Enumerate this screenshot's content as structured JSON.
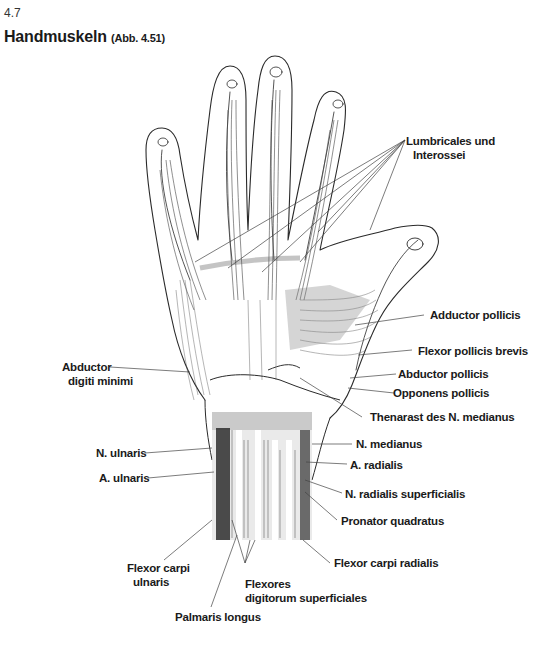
{
  "section": "4.7",
  "title": "Handmuskeln",
  "figure_ref": "(Abb. 4.51)",
  "labels": {
    "lumbricales": [
      "Lumbricales und",
      "Interossei"
    ],
    "adductor_pollicis_1": "Adductor pollicis",
    "flexor_pollicis_brevis": "Flexor pollicis brevis",
    "abductor_pollicis": "Abductor pollicis",
    "opponens_pollicis": "Opponens pollicis",
    "thenarast": "Thenarast des N. medianus",
    "abductor_digiti_minimi": [
      "Abductor",
      "digiti minimi"
    ],
    "n_medianus": "N. medianus",
    "a_radialis": "A. radialis",
    "n_radialis_superficialis": "N. radialis superficialis",
    "pronator_quadratus": "Pronator quadratus",
    "flexor_carpi_radialis": "Flexor carpi radialis",
    "n_ulnaris": "N. ulnaris",
    "a_ulnaris": "A. ulnaris",
    "flexor_carpi_ulnaris": [
      "Flexor carpi",
      "ulnaris"
    ],
    "flexores_digitorum": [
      "Flexores",
      "digitorum superficiales"
    ],
    "palmaris_longus": "Palmaris longus"
  }
}
